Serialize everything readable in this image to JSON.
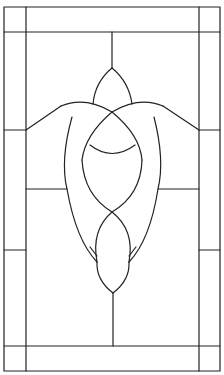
{
  "pattern": {
    "description": "Stained glass window pattern line drawing",
    "stroke_color": "#222222",
    "background_color": "#ffffff",
    "frame": {
      "x": 4,
      "y": 7,
      "width": 216,
      "height": 364
    },
    "inner_border": {
      "left_x": 26,
      "right_x": 199,
      "top_y": 32,
      "bottom_y": 346
    }
  }
}
